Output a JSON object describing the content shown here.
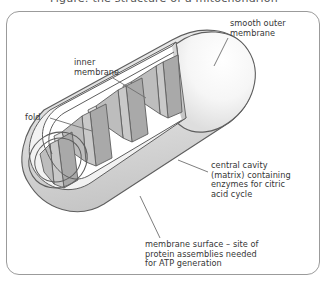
{
  "figure": {
    "title_sliver": "Figure: the structure of a mitochondrion",
    "frame_color": "#9b9b9b",
    "background_color": "#ffffff",
    "text_color": "#363636"
  },
  "labels": {
    "smooth_outer_membrane": "smooth outer\nmembrane",
    "inner_membrane": "inner\nmembrane",
    "fold": "fold",
    "central_cavity": "central cavity\n(matrix) containing\nenzymes for citric\nacid cycle",
    "membrane_surface": "membrane surface – site of\nprotein assemblies needed\nfor ATP generation"
  },
  "diagram": {
    "outline_color": "#595959",
    "outer_membrane_fill": "#f7f7f7",
    "cut_plane_fill": "#d2d2d2",
    "crista_face_fill": "#a9a9a9",
    "crista_side_fill": "#c9c9c9",
    "inner_wall_fill": "#ededed",
    "matrix_fill": "#9f9f9f",
    "leader_line_color": "#6e6e6e"
  }
}
